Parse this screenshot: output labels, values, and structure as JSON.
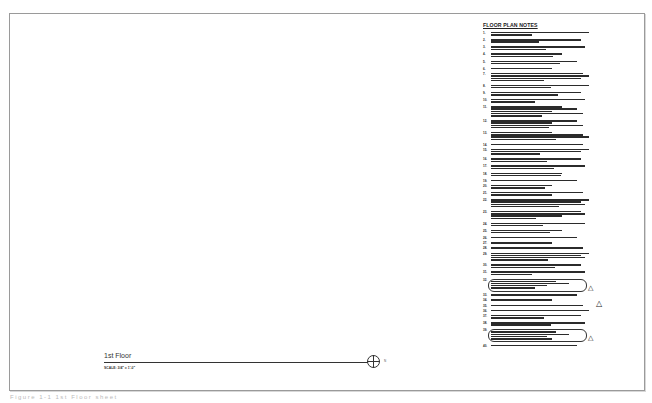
{
  "sheet": {
    "notes_title": "FLOOR PLAN NOTES",
    "notes": [
      {
        "num": "1.",
        "lines": 2
      },
      {
        "num": "2.",
        "lines": 2
      },
      {
        "num": "3.",
        "lines": 2
      },
      {
        "num": "4.",
        "lines": 2
      },
      {
        "num": "5.",
        "lines": 2
      },
      {
        "num": "6.",
        "lines": 1
      },
      {
        "num": "7.",
        "lines": 4
      },
      {
        "num": "8.",
        "lines": 2
      },
      {
        "num": "9.",
        "lines": 2
      },
      {
        "num": "10.",
        "lines": 2
      },
      {
        "num": "11.",
        "lines": 5
      },
      {
        "num": "12.",
        "lines": 4
      },
      {
        "num": "13.",
        "lines": 4
      },
      {
        "num": "14.",
        "lines": 1
      },
      {
        "num": "15.",
        "lines": 3
      },
      {
        "num": "16.",
        "lines": 2
      },
      {
        "num": "17.",
        "lines": 2
      },
      {
        "num": "18.",
        "lines": 2
      },
      {
        "num": "19.",
        "lines": 1
      },
      {
        "num": "20.",
        "lines": 2
      },
      {
        "num": "21.",
        "lines": 2
      },
      {
        "num": "22.",
        "lines": 4
      },
      {
        "num": "23.",
        "lines": 4
      },
      {
        "num": "24.",
        "lines": 2
      },
      {
        "num": "25.",
        "lines": 2
      },
      {
        "num": "26.",
        "lines": 1
      },
      {
        "num": "27.",
        "lines": 1
      },
      {
        "num": "28.",
        "lines": 1
      },
      {
        "num": "29.",
        "lines": 4
      },
      {
        "num": "30.",
        "lines": 2
      },
      {
        "num": "31.",
        "lines": 2
      },
      {
        "num": "32.",
        "lines": 4,
        "clouded": true
      },
      {
        "num": "33.",
        "lines": 1
      },
      {
        "num": "34.",
        "lines": 1
      },
      {
        "num": "35.",
        "lines": 1
      },
      {
        "num": "36.",
        "lines": 1
      },
      {
        "num": "37.",
        "lines": 2
      },
      {
        "num": "38.",
        "lines": 2
      },
      {
        "num": "39.",
        "lines": 4,
        "clouded": true
      },
      {
        "num": "40.",
        "lines": 1
      }
    ],
    "revision_marker": "1",
    "view_title": "1st Floor",
    "view_scale": "SCALE: 3/4\" = 1'-0\"",
    "north_label": "N"
  },
  "caption": "Figure 1-1 1st Floor sheet"
}
